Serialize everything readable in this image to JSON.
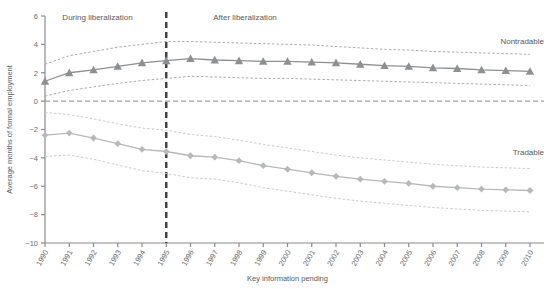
{
  "chart_data": {
    "type": "line",
    "title": "",
    "xlabel": "Key information pending",
    "ylabel": "Average months of formal employment",
    "xlim": [
      1990,
      2010
    ],
    "ylim": [
      -10,
      6
    ],
    "yticks": [
      6,
      4,
      2,
      0,
      -2,
      -4,
      -6,
      -8,
      -10
    ],
    "ytick_labels": [
      "6",
      "4",
      "2",
      "0",
      "−2",
      "−4",
      "−6",
      "−8",
      "−10"
    ],
    "grid": false,
    "legend_position": "inline-right",
    "categories": [
      1990,
      1991,
      1992,
      1993,
      1994,
      1995,
      1996,
      1997,
      1998,
      1999,
      2000,
      2001,
      2002,
      2003,
      2004,
      2005,
      2006,
      2007,
      2008,
      2009,
      2010
    ],
    "xtick_labels": [
      "1990",
      "1991",
      "1992",
      "1993",
      "1994",
      "1995",
      "1996",
      "1997",
      "1998",
      "1999",
      "2000",
      "2001",
      "2002",
      "2003",
      "2004",
      "2005",
      "2006",
      "2007",
      "2008",
      "2009",
      "2010"
    ],
    "series": [
      {
        "name": "Nontradable",
        "marker": "triangle",
        "color": "#8d8f91",
        "values": [
          1.4,
          2.0,
          2.2,
          2.45,
          2.7,
          2.85,
          3.0,
          2.9,
          2.85,
          2.8,
          2.8,
          2.75,
          2.7,
          2.6,
          2.5,
          2.45,
          2.35,
          2.3,
          2.2,
          2.15,
          2.1
        ],
        "ci_upper": [
          2.6,
          3.2,
          3.5,
          3.8,
          4.0,
          4.2,
          4.2,
          4.15,
          4.1,
          4.05,
          4.0,
          3.95,
          3.85,
          3.75,
          3.65,
          3.6,
          3.5,
          3.45,
          3.4,
          3.35,
          3.3
        ],
        "ci_lower": [
          0.35,
          0.75,
          1.0,
          1.25,
          1.45,
          1.6,
          1.75,
          1.7,
          1.65,
          1.6,
          1.6,
          1.55,
          1.5,
          1.45,
          1.4,
          1.35,
          1.3,
          1.25,
          1.2,
          1.15,
          1.1
        ]
      },
      {
        "name": "Tradable",
        "marker": "diamond",
        "color": "#b6b8ba",
        "values": [
          -2.4,
          -2.25,
          -2.6,
          -3.0,
          -3.4,
          -3.55,
          -3.85,
          -3.95,
          -4.2,
          -4.55,
          -4.8,
          -5.05,
          -5.3,
          -5.5,
          -5.65,
          -5.8,
          -6.0,
          -6.1,
          -6.2,
          -6.25,
          -6.3
        ],
        "ci_upper": [
          -0.8,
          -0.95,
          -1.25,
          -1.6,
          -1.9,
          -2.05,
          -2.35,
          -2.5,
          -2.75,
          -3.05,
          -3.3,
          -3.55,
          -3.8,
          -4.0,
          -4.15,
          -4.3,
          -4.45,
          -4.55,
          -4.65,
          -4.7,
          -4.75
        ],
        "ci_lower": [
          -3.9,
          -3.8,
          -4.1,
          -4.5,
          -4.9,
          -5.1,
          -5.4,
          -5.5,
          -5.75,
          -6.1,
          -6.35,
          -6.6,
          -6.85,
          -7.05,
          -7.2,
          -7.35,
          -7.5,
          -7.6,
          -7.7,
          -7.75,
          -7.8
        ]
      }
    ],
    "annotations": [
      {
        "text": "During liberalization",
        "x": 1992.4,
        "position": "top-left"
      },
      {
        "text": "After liberalization",
        "x": 1998.4,
        "position": "top-right"
      },
      {
        "text": "Nontradable",
        "position": "right-upper"
      },
      {
        "text": "Tradable",
        "position": "right-lower"
      }
    ],
    "reference_lines": [
      {
        "orientation": "vertical",
        "value": 1995,
        "style": "dashed",
        "color": "#3d3d3f"
      },
      {
        "orientation": "horizontal",
        "value": 0,
        "style": "dashed",
        "color": "#8a8a8c"
      }
    ]
  }
}
